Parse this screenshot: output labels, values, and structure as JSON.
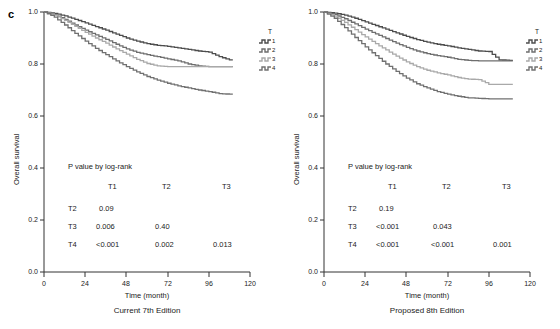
{
  "figure": {
    "panel_letter": "c",
    "axis": {
      "ylabel": "Overall survival",
      "xlabel": "Time (month)",
      "yticks": [
        "0.0",
        "0.2",
        "0.4",
        "0.6",
        "0.8",
        "1.0"
      ],
      "xticks": [
        "0",
        "24",
        "48",
        "72",
        "96",
        "120"
      ],
      "xlim": [
        0,
        120
      ],
      "ylim": [
        0.0,
        1.0
      ]
    },
    "legend": {
      "title": "T",
      "entries": [
        "1",
        "2",
        "3",
        "4"
      ],
      "colors": [
        "#4d4d4d",
        "#6e6e6e",
        "#a9a9a9",
        "#707070"
      ]
    },
    "panels": [
      {
        "id": "current-7th",
        "caption": "Current 7th Edition",
        "ptable": {
          "title": "P value by log-rank",
          "col_headers": [
            "T1",
            "T2",
            "T3"
          ],
          "row_headers": [
            "T2",
            "T3",
            "T4"
          ],
          "rows": [
            [
              "0.09",
              "",
              ""
            ],
            [
              "0.006",
              "0.40",
              ""
            ],
            [
              "<0.001",
              "0.002",
              "0.013"
            ]
          ]
        }
      },
      {
        "id": "proposed-8th",
        "caption": "Proposed 8th Edition",
        "ptable": {
          "title": "P value by log-rank",
          "col_headers": [
            "T1",
            "T2",
            "T3"
          ],
          "row_headers": [
            "T2",
            "T3",
            "T4"
          ],
          "rows": [
            [
              "0.19",
              "",
              ""
            ],
            [
              "<0.001",
              "0.043",
              ""
            ],
            [
              "<0.001",
              "<0.001",
              "0.001"
            ]
          ]
        }
      }
    ]
  },
  "chart_data": {
    "type": "line",
    "subtype": "kaplan-meier-step",
    "title": "",
    "xlabel": "Time (month)",
    "ylabel": "Overall survival",
    "xlim": [
      0,
      120
    ],
    "ylim": [
      0.0,
      1.0
    ],
    "grid": false,
    "legend_position": "right-outside",
    "legend_title": "T",
    "panels": [
      {
        "name": "Current 7th Edition",
        "series": [
          {
            "name": "T1",
            "color": "#4d4d4d",
            "points": [
              [
                0,
                1.0
              ],
              [
                6,
                0.995
              ],
              [
                12,
                0.985
              ],
              [
                18,
                0.972
              ],
              [
                24,
                0.958
              ],
              [
                30,
                0.944
              ],
              [
                36,
                0.93
              ],
              [
                42,
                0.915
              ],
              [
                48,
                0.9
              ],
              [
                54,
                0.888
              ],
              [
                60,
                0.878
              ],
              [
                66,
                0.872
              ],
              [
                72,
                0.868
              ],
              [
                78,
                0.862
              ],
              [
                84,
                0.856
              ],
              [
                90,
                0.85
              ],
              [
                96,
                0.846
              ],
              [
                102,
                0.828
              ],
              [
                108,
                0.816
              ],
              [
                110,
                0.816
              ]
            ]
          },
          {
            "name": "T2",
            "color": "#6e6e6e",
            "points": [
              [
                0,
                1.0
              ],
              [
                6,
                0.99
              ],
              [
                12,
                0.972
              ],
              [
                18,
                0.95
              ],
              [
                24,
                0.93
              ],
              [
                30,
                0.912
              ],
              [
                36,
                0.895
              ],
              [
                42,
                0.876
              ],
              [
                48,
                0.858
              ],
              [
                54,
                0.845
              ],
              [
                60,
                0.836
              ],
              [
                66,
                0.828
              ],
              [
                72,
                0.82
              ],
              [
                78,
                0.812
              ],
              [
                84,
                0.8
              ],
              [
                90,
                0.793
              ],
              [
                96,
                0.79
              ],
              [
                102,
                0.79
              ],
              [
                108,
                0.79
              ],
              [
                110,
                0.79
              ]
            ]
          },
          {
            "name": "T3",
            "color": "#a9a9a9",
            "points": [
              [
                0,
                1.0
              ],
              [
                6,
                0.988
              ],
              [
                12,
                0.968
              ],
              [
                18,
                0.945
              ],
              [
                24,
                0.922
              ],
              [
                30,
                0.9
              ],
              [
                36,
                0.88
              ],
              [
                42,
                0.858
              ],
              [
                48,
                0.838
              ],
              [
                54,
                0.818
              ],
              [
                60,
                0.802
              ],
              [
                66,
                0.793
              ],
              [
                72,
                0.79
              ],
              [
                78,
                0.79
              ],
              [
                84,
                0.79
              ],
              [
                90,
                0.79
              ],
              [
                96,
                0.79
              ],
              [
                102,
                0.79
              ],
              [
                108,
                0.79
              ],
              [
                110,
                0.79
              ]
            ]
          },
          {
            "name": "T4",
            "color": "#707070",
            "points": [
              [
                0,
                1.0
              ],
              [
                6,
                0.98
              ],
              [
                12,
                0.95
              ],
              [
                18,
                0.918
              ],
              [
                24,
                0.888
              ],
              [
                30,
                0.86
              ],
              [
                36,
                0.836
              ],
              [
                42,
                0.812
              ],
              [
                48,
                0.79
              ],
              [
                54,
                0.77
              ],
              [
                60,
                0.752
              ],
              [
                66,
                0.738
              ],
              [
                72,
                0.726
              ],
              [
                78,
                0.716
              ],
              [
                84,
                0.708
              ],
              [
                90,
                0.7
              ],
              [
                96,
                0.694
              ],
              [
                102,
                0.686
              ],
              [
                108,
                0.684
              ],
              [
                110,
                0.684
              ]
            ]
          }
        ]
      },
      {
        "name": "Proposed 8th Edition",
        "series": [
          {
            "name": "T1",
            "color": "#4d4d4d",
            "points": [
              [
                0,
                1.0
              ],
              [
                6,
                0.996
              ],
              [
                12,
                0.988
              ],
              [
                18,
                0.976
              ],
              [
                24,
                0.962
              ],
              [
                30,
                0.948
              ],
              [
                36,
                0.934
              ],
              [
                42,
                0.92
              ],
              [
                48,
                0.906
              ],
              [
                54,
                0.894
              ],
              [
                60,
                0.884
              ],
              [
                66,
                0.876
              ],
              [
                72,
                0.87
              ],
              [
                78,
                0.862
              ],
              [
                84,
                0.856
              ],
              [
                90,
                0.85
              ],
              [
                96,
                0.848
              ],
              [
                102,
                0.816
              ],
              [
                108,
                0.814
              ],
              [
                110,
                0.814
              ]
            ]
          },
          {
            "name": "T2",
            "color": "#6e6e6e",
            "points": [
              [
                0,
                1.0
              ],
              [
                6,
                0.99
              ],
              [
                12,
                0.974
              ],
              [
                18,
                0.954
              ],
              [
                24,
                0.934
              ],
              [
                30,
                0.916
              ],
              [
                36,
                0.898
              ],
              [
                42,
                0.88
              ],
              [
                48,
                0.864
              ],
              [
                54,
                0.85
              ],
              [
                60,
                0.84
              ],
              [
                66,
                0.832
              ],
              [
                72,
                0.826
              ],
              [
                78,
                0.818
              ],
              [
                84,
                0.814
              ],
              [
                90,
                0.812
              ],
              [
                96,
                0.812
              ],
              [
                102,
                0.812
              ],
              [
                108,
                0.812
              ],
              [
                110,
                0.812
              ]
            ]
          },
          {
            "name": "T3",
            "color": "#a9a9a9",
            "points": [
              [
                0,
                1.0
              ],
              [
                6,
                0.984
              ],
              [
                12,
                0.96
              ],
              [
                18,
                0.932
              ],
              [
                24,
                0.904
              ],
              [
                30,
                0.878
              ],
              [
                36,
                0.854
              ],
              [
                42,
                0.83
              ],
              [
                48,
                0.808
              ],
              [
                54,
                0.79
              ],
              [
                60,
                0.776
              ],
              [
                66,
                0.766
              ],
              [
                72,
                0.758
              ],
              [
                78,
                0.748
              ],
              [
                84,
                0.742
              ],
              [
                90,
                0.74
              ],
              [
                96,
                0.722
              ],
              [
                102,
                0.722
              ],
              [
                108,
                0.722
              ],
              [
                110,
                0.722
              ]
            ]
          },
          {
            "name": "T4",
            "color": "#707070",
            "points": [
              [
                0,
                1.0
              ],
              [
                6,
                0.976
              ],
              [
                12,
                0.94
              ],
              [
                18,
                0.902
              ],
              [
                24,
                0.866
              ],
              [
                30,
                0.832
              ],
              [
                36,
                0.8
              ],
              [
                42,
                0.772
              ],
              [
                48,
                0.746
              ],
              [
                54,
                0.724
              ],
              [
                60,
                0.708
              ],
              [
                66,
                0.694
              ],
              [
                72,
                0.684
              ],
              [
                78,
                0.676
              ],
              [
                84,
                0.67
              ],
              [
                90,
                0.668
              ],
              [
                96,
                0.666
              ],
              [
                102,
                0.666
              ],
              [
                108,
                0.666
              ],
              [
                110,
                0.666
              ]
            ]
          }
        ]
      }
    ]
  }
}
